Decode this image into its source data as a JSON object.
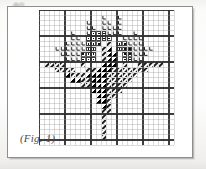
{
  "figure": {
    "caption": "(Fig. 1)",
    "frame_color": "#8e8e8e",
    "background_color": "#ffffff"
  },
  "chart_data": {
    "type": "heatmap",
    "title": "(Fig. 1)",
    "xlabel": "",
    "ylabel": "",
    "grid": true,
    "legend_position": "none",
    "columns": 26,
    "rows": 26,
    "cell_px": 5.2,
    "heavy_line_every": 5,
    "light_line_color": "#9a9a9a",
    "heavy_line_color": "#2e2e2e",
    "symbol_legend": [
      {
        "key": "L",
        "name": "letter-L-stitch",
        "color": "#1a1a1a"
      },
      {
        "key": "D",
        "name": "filled-square-dot-stitch",
        "color": "#111111"
      },
      {
        "key": "T",
        "name": "solid-triangle-half-stitch",
        "color": "#000000"
      },
      {
        "key": "H",
        "name": "diagonal-hatch-stitch",
        "color": "#222222"
      }
    ],
    "cells": [
      {
        "c": 12,
        "r": 1,
        "s": "L"
      },
      {
        "c": 15,
        "r": 1,
        "s": "L"
      },
      {
        "c": 9,
        "r": 2,
        "s": "L"
      },
      {
        "c": 12,
        "r": 2,
        "s": "L"
      },
      {
        "c": 13,
        "r": 2,
        "s": "L"
      },
      {
        "c": 15,
        "r": 2,
        "s": "L"
      },
      {
        "c": 9,
        "r": 3,
        "s": "L"
      },
      {
        "c": 10,
        "r": 3,
        "s": "L"
      },
      {
        "c": 12,
        "r": 3,
        "s": "L"
      },
      {
        "c": 13,
        "r": 3,
        "s": "L"
      },
      {
        "c": 14,
        "r": 3,
        "s": "L"
      },
      {
        "c": 15,
        "r": 3,
        "s": "L"
      },
      {
        "c": 6,
        "r": 4,
        "s": "L"
      },
      {
        "c": 9,
        "r": 4,
        "s": "L"
      },
      {
        "c": 10,
        "r": 4,
        "s": "D"
      },
      {
        "c": 11,
        "r": 4,
        "s": "D"
      },
      {
        "c": 12,
        "r": 4,
        "s": "D"
      },
      {
        "c": 13,
        "r": 4,
        "s": "L"
      },
      {
        "c": 14,
        "r": 4,
        "s": "L"
      },
      {
        "c": 15,
        "r": 4,
        "s": "L"
      },
      {
        "c": 18,
        "r": 4,
        "s": "L"
      },
      {
        "c": 6,
        "r": 5,
        "s": "L"
      },
      {
        "c": 7,
        "r": 5,
        "s": "L"
      },
      {
        "c": 9,
        "r": 5,
        "s": "D"
      },
      {
        "c": 10,
        "r": 5,
        "s": "D"
      },
      {
        "c": 11,
        "r": 5,
        "s": "D"
      },
      {
        "c": 12,
        "r": 5,
        "s": "D"
      },
      {
        "c": 13,
        "r": 5,
        "s": "D"
      },
      {
        "c": 16,
        "r": 5,
        "s": "L"
      },
      {
        "c": 17,
        "r": 5,
        "s": "L"
      },
      {
        "c": 18,
        "r": 5,
        "s": "L"
      },
      {
        "c": 19,
        "r": 5,
        "s": "L"
      },
      {
        "c": 5,
        "r": 6,
        "s": "L"
      },
      {
        "c": 6,
        "r": 6,
        "s": "L"
      },
      {
        "c": 7,
        "r": 6,
        "s": "L"
      },
      {
        "c": 8,
        "r": 6,
        "s": "L"
      },
      {
        "c": 9,
        "r": 6,
        "s": "D"
      },
      {
        "c": 10,
        "r": 6,
        "s": "D"
      },
      {
        "c": 11,
        "r": 6,
        "s": "D"
      },
      {
        "c": 13,
        "r": 6,
        "s": "H"
      },
      {
        "c": 15,
        "r": 6,
        "s": "D"
      },
      {
        "c": 16,
        "r": 6,
        "s": "D"
      },
      {
        "c": 17,
        "r": 6,
        "s": "L"
      },
      {
        "c": 18,
        "r": 6,
        "s": "L"
      },
      {
        "c": 19,
        "r": 6,
        "s": "L"
      },
      {
        "c": 3,
        "r": 7,
        "s": "L"
      },
      {
        "c": 4,
        "r": 7,
        "s": "L"
      },
      {
        "c": 5,
        "r": 7,
        "s": "L"
      },
      {
        "c": 6,
        "r": 7,
        "s": "L"
      },
      {
        "c": 7,
        "r": 7,
        "s": "L"
      },
      {
        "c": 8,
        "r": 7,
        "s": "L"
      },
      {
        "c": 9,
        "r": 7,
        "s": "D"
      },
      {
        "c": 10,
        "r": 7,
        "s": "D"
      },
      {
        "c": 12,
        "r": 7,
        "s": "H"
      },
      {
        "c": 13,
        "r": 7,
        "s": "T"
      },
      {
        "c": 15,
        "r": 7,
        "s": "D"
      },
      {
        "c": 16,
        "r": 7,
        "s": "D"
      },
      {
        "c": 17,
        "r": 7,
        "s": "D"
      },
      {
        "c": 18,
        "r": 7,
        "s": "L"
      },
      {
        "c": 19,
        "r": 7,
        "s": "L"
      },
      {
        "c": 20,
        "r": 7,
        "s": "L"
      },
      {
        "c": 21,
        "r": 7,
        "s": "L"
      },
      {
        "c": 4,
        "r": 8,
        "s": "L"
      },
      {
        "c": 5,
        "r": 8,
        "s": "L"
      },
      {
        "c": 6,
        "r": 8,
        "s": "L"
      },
      {
        "c": 7,
        "r": 8,
        "s": "L"
      },
      {
        "c": 8,
        "r": 8,
        "s": "D"
      },
      {
        "c": 9,
        "r": 8,
        "s": "D"
      },
      {
        "c": 10,
        "r": 8,
        "s": "D"
      },
      {
        "c": 12,
        "r": 8,
        "s": "H"
      },
      {
        "c": 13,
        "r": 8,
        "s": "T"
      },
      {
        "c": 14,
        "r": 8,
        "s": "T"
      },
      {
        "c": 16,
        "r": 8,
        "s": "D"
      },
      {
        "c": 17,
        "r": 8,
        "s": "D"
      },
      {
        "c": 18,
        "r": 8,
        "s": "L"
      },
      {
        "c": 19,
        "r": 8,
        "s": "L"
      },
      {
        "c": 20,
        "r": 8,
        "s": "L"
      },
      {
        "c": 5,
        "r": 9,
        "s": "L"
      },
      {
        "c": 6,
        "r": 9,
        "s": "L"
      },
      {
        "c": 7,
        "r": 9,
        "s": "L"
      },
      {
        "c": 8,
        "r": 9,
        "s": "D"
      },
      {
        "c": 9,
        "r": 9,
        "s": "D"
      },
      {
        "c": 10,
        "r": 9,
        "s": "D"
      },
      {
        "c": 12,
        "r": 9,
        "s": "H"
      },
      {
        "c": 13,
        "r": 9,
        "s": "T"
      },
      {
        "c": 14,
        "r": 9,
        "s": "T"
      },
      {
        "c": 16,
        "r": 9,
        "s": "D"
      },
      {
        "c": 17,
        "r": 9,
        "s": "D"
      },
      {
        "c": 18,
        "r": 9,
        "s": "L"
      },
      {
        "c": 19,
        "r": 9,
        "s": "L"
      },
      {
        "c": 1,
        "r": 10,
        "s": "H"
      },
      {
        "c": 2,
        "r": 10,
        "s": "H"
      },
      {
        "c": 3,
        "r": 10,
        "s": "H"
      },
      {
        "c": 4,
        "r": 10,
        "s": "H"
      },
      {
        "c": 8,
        "r": 10,
        "s": "H"
      },
      {
        "c": 12,
        "r": 10,
        "s": "T"
      },
      {
        "c": 13,
        "r": 10,
        "s": "T"
      },
      {
        "c": 14,
        "r": 10,
        "s": "T"
      },
      {
        "c": 16,
        "r": 10,
        "s": "H"
      },
      {
        "c": 19,
        "r": 10,
        "s": "H"
      },
      {
        "c": 20,
        "r": 10,
        "s": "H"
      },
      {
        "c": 21,
        "r": 10,
        "s": "H"
      },
      {
        "c": 22,
        "r": 10,
        "s": "H"
      },
      {
        "c": 23,
        "r": 10,
        "s": "H"
      },
      {
        "c": 3,
        "r": 11,
        "s": "H"
      },
      {
        "c": 4,
        "r": 11,
        "s": "H"
      },
      {
        "c": 5,
        "r": 11,
        "s": "H"
      },
      {
        "c": 6,
        "r": 11,
        "s": "H"
      },
      {
        "c": 9,
        "r": 11,
        "s": "H"
      },
      {
        "c": 10,
        "r": 11,
        "s": "H"
      },
      {
        "c": 11,
        "r": 11,
        "s": "T"
      },
      {
        "c": 12,
        "r": 11,
        "s": "T"
      },
      {
        "c": 13,
        "r": 11,
        "s": "T"
      },
      {
        "c": 14,
        "r": 11,
        "s": "H"
      },
      {
        "c": 15,
        "r": 11,
        "s": "H"
      },
      {
        "c": 16,
        "r": 11,
        "s": "H"
      },
      {
        "c": 17,
        "r": 11,
        "s": "H"
      },
      {
        "c": 18,
        "r": 11,
        "s": "H"
      },
      {
        "c": 19,
        "r": 11,
        "s": "H"
      },
      {
        "c": 20,
        "r": 11,
        "s": "H"
      },
      {
        "c": 5,
        "r": 12,
        "s": "T"
      },
      {
        "c": 6,
        "r": 12,
        "s": "H"
      },
      {
        "c": 7,
        "r": 12,
        "s": "H"
      },
      {
        "c": 8,
        "r": 12,
        "s": "H"
      },
      {
        "c": 9,
        "r": 12,
        "s": "T"
      },
      {
        "c": 10,
        "r": 12,
        "s": "T"
      },
      {
        "c": 11,
        "r": 12,
        "s": "T"
      },
      {
        "c": 12,
        "r": 12,
        "s": "T"
      },
      {
        "c": 13,
        "r": 12,
        "s": "H"
      },
      {
        "c": 14,
        "r": 12,
        "s": "H"
      },
      {
        "c": 15,
        "r": 12,
        "s": "H"
      },
      {
        "c": 16,
        "r": 12,
        "s": "H"
      },
      {
        "c": 17,
        "r": 12,
        "s": "H"
      },
      {
        "c": 18,
        "r": 12,
        "s": "H"
      },
      {
        "c": 6,
        "r": 13,
        "s": "T"
      },
      {
        "c": 7,
        "r": 13,
        "s": "T"
      },
      {
        "c": 8,
        "r": 13,
        "s": "H"
      },
      {
        "c": 9,
        "r": 13,
        "s": "H"
      },
      {
        "c": 10,
        "r": 13,
        "s": "T"
      },
      {
        "c": 11,
        "r": 13,
        "s": "T"
      },
      {
        "c": 12,
        "r": 13,
        "s": "T"
      },
      {
        "c": 13,
        "r": 13,
        "s": "H"
      },
      {
        "c": 14,
        "r": 13,
        "s": "H"
      },
      {
        "c": 15,
        "r": 13,
        "s": "H"
      },
      {
        "c": 16,
        "r": 13,
        "s": "H"
      },
      {
        "c": 17,
        "r": 13,
        "s": "H"
      },
      {
        "c": 8,
        "r": 14,
        "s": "H"
      },
      {
        "c": 9,
        "r": 14,
        "s": "H"
      },
      {
        "c": 10,
        "r": 14,
        "s": "T"
      },
      {
        "c": 11,
        "r": 14,
        "s": "T"
      },
      {
        "c": 12,
        "r": 14,
        "s": "T"
      },
      {
        "c": 13,
        "r": 14,
        "s": "H"
      },
      {
        "c": 14,
        "r": 14,
        "s": "H"
      },
      {
        "c": 15,
        "r": 14,
        "s": "H"
      },
      {
        "c": 16,
        "r": 14,
        "s": "H"
      },
      {
        "c": 10,
        "r": 15,
        "s": "T"
      },
      {
        "c": 11,
        "r": 15,
        "s": "T"
      },
      {
        "c": 12,
        "r": 15,
        "s": "T"
      },
      {
        "c": 13,
        "r": 15,
        "s": "H"
      },
      {
        "c": 14,
        "r": 15,
        "s": "H"
      },
      {
        "c": 15,
        "r": 15,
        "s": "H"
      },
      {
        "c": 11,
        "r": 16,
        "s": "T"
      },
      {
        "c": 12,
        "r": 16,
        "s": "T"
      },
      {
        "c": 13,
        "r": 16,
        "s": "H"
      },
      {
        "c": 14,
        "r": 16,
        "s": "H"
      },
      {
        "c": 11,
        "r": 17,
        "s": "T"
      },
      {
        "c": 12,
        "r": 17,
        "s": "T"
      },
      {
        "c": 13,
        "r": 17,
        "s": "H"
      },
      {
        "c": 12,
        "r": 18,
        "s": "T"
      },
      {
        "c": 13,
        "r": 18,
        "s": "H"
      },
      {
        "c": 12,
        "r": 19,
        "s": "H"
      },
      {
        "c": 13,
        "r": 19,
        "s": "H"
      },
      {
        "c": 12,
        "r": 20,
        "s": "H"
      },
      {
        "c": 12,
        "r": 21,
        "s": "H"
      },
      {
        "c": 12,
        "r": 22,
        "s": "H"
      },
      {
        "c": 12,
        "r": 23,
        "s": "H"
      },
      {
        "c": 12,
        "r": 24,
        "s": "H"
      }
    ]
  }
}
